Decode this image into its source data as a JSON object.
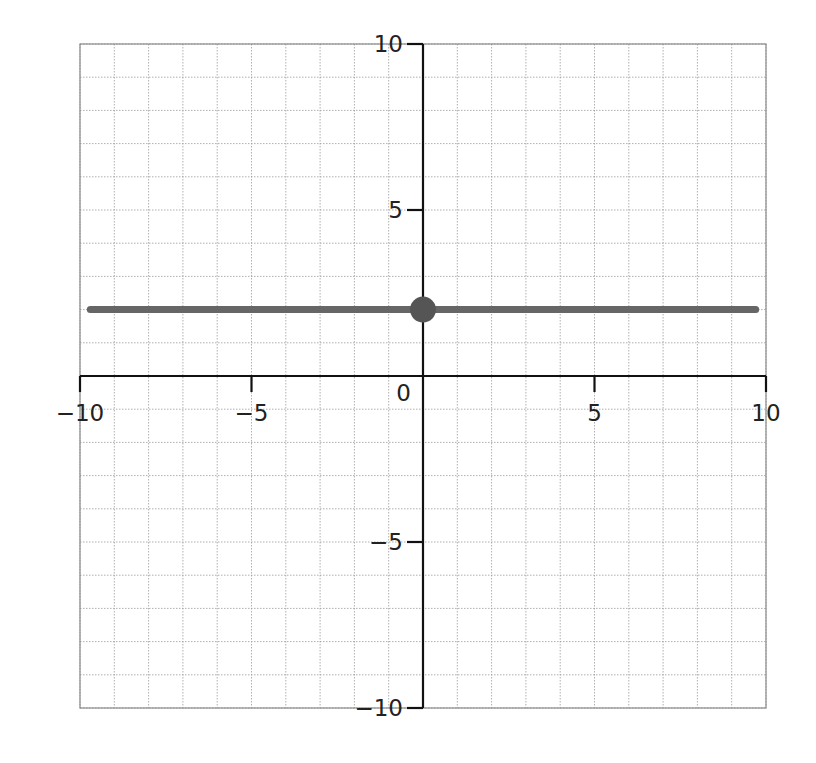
{
  "chart_data": {
    "type": "line",
    "title": "",
    "xlabel": "",
    "ylabel": "",
    "xlim": [
      -10,
      10
    ],
    "ylim": [
      -10,
      10
    ],
    "grid": true,
    "grid_step": 1,
    "x_ticks": [
      -10,
      -5,
      0,
      5,
      10
    ],
    "y_ticks": [
      -10,
      -5,
      5,
      10
    ],
    "x_tick_labels": [
      "−10",
      "−5",
      "0",
      "5",
      "10"
    ],
    "y_tick_labels": [
      "−10",
      "−5",
      "5",
      "10"
    ],
    "origin_label": "0",
    "series": [
      {
        "name": "y = 2",
        "kind": "line",
        "x": [
          -9.7,
          9.7
        ],
        "y": [
          2,
          2
        ],
        "color": "#666666"
      }
    ],
    "points": [
      {
        "name": "y-intercept",
        "x": 0,
        "y": 2,
        "color": "#555555"
      }
    ]
  },
  "colors": {
    "axis": "#111111",
    "grid": "#9a9a9a",
    "frame": "#8a8a8a",
    "line": "#666666",
    "point": "#555555"
  }
}
